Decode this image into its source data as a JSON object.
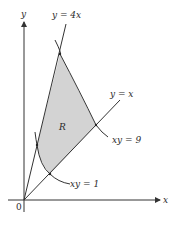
{
  "figure": {
    "axes": {
      "x_label": "x",
      "y_label": "y",
      "origin_label": "0"
    },
    "curves": [
      {
        "name": "line-y-4x",
        "label": "y = 4x"
      },
      {
        "name": "line-y-x",
        "label": "y = x"
      },
      {
        "name": "hyperbola-xy-9",
        "label": "xy = 9"
      },
      {
        "name": "hyperbola-xy-1",
        "label": "xy = 1"
      }
    ],
    "region": {
      "label": "R",
      "fill": "#d3d3d3"
    },
    "colors": {
      "stroke": "#333333",
      "region_fill": "#d3d3d3"
    }
  }
}
